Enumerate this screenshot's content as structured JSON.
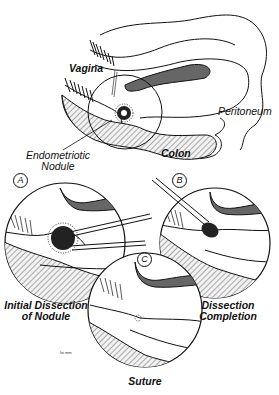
{
  "diagram": {
    "overview": {
      "labels": {
        "vagina": "Vagina",
        "colon": "Colon",
        "peritoneum": "Peritoneum",
        "nodule_line1": "Endometriotic",
        "nodule_line2": "Nodule"
      }
    },
    "panels": [
      {
        "letter": "A",
        "caption_line1": "Initial Dissection",
        "caption_line2": "of Nodule"
      },
      {
        "letter": "B",
        "caption_line1": "Dissection",
        "caption_line2": "Completion"
      },
      {
        "letter": "C",
        "caption_line1": "Suture",
        "caption_line2": ""
      }
    ],
    "signature": "lw mm"
  }
}
